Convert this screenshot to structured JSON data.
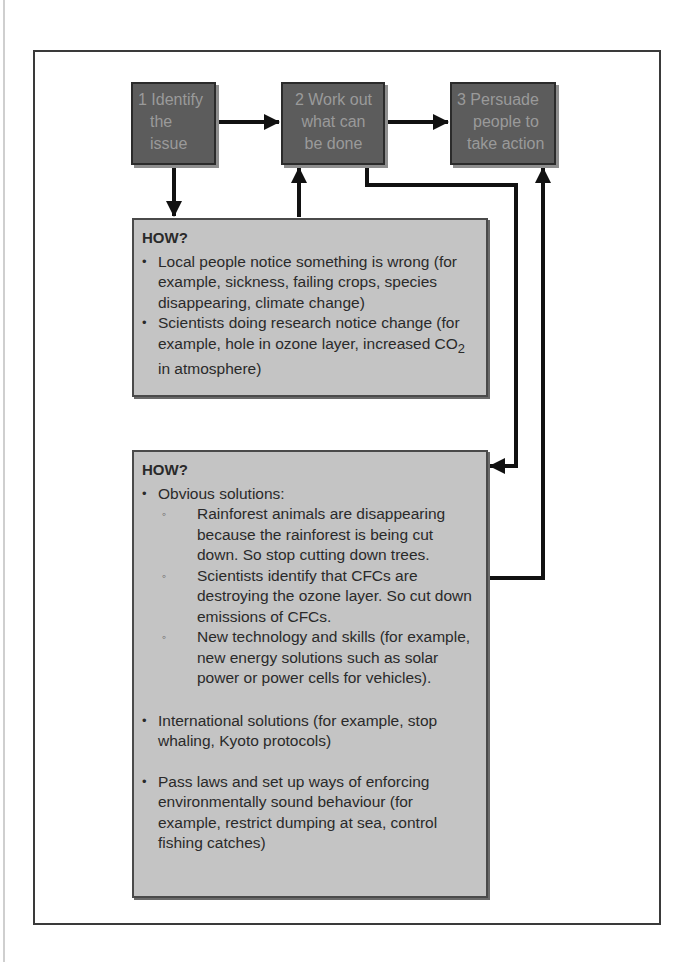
{
  "steps": [
    {
      "label": "1 Identify the issue",
      "lines": [
        "1 Identify",
        "the",
        "issue"
      ]
    },
    {
      "label": "2 Work out what can be done",
      "lines": [
        "2 Work out",
        "what can",
        "be done"
      ]
    },
    {
      "label": "3 Persuade people to take action",
      "lines": [
        "3 Persuade",
        "people to",
        "take action"
      ]
    }
  ],
  "how_box_1": {
    "title": "HOW?",
    "bullets": [
      "Local people notice something is wrong (for example, sickness, failing crops, species disappearing, climate change)",
      "Scientists doing research notice change (for example, hole in ozone layer, increased CO₂ in atmosphere)"
    ]
  },
  "how_box_2": {
    "title": "HOW?",
    "bullet_1": "Obvious solutions:",
    "sub_bullets": [
      "Rainforest animals are disappearing because the rainforest is being cut down. So stop cutting down trees.",
      "Scientists identify that CFCs are destroying the ozone layer. So cut down emissions of CFCs.",
      "New technology and skills (for example, new energy solutions such as solar power or power cells for vehicles)."
    ],
    "bullet_2": "International solutions (for example, stop whaling, Kyoto protocols)",
    "bullet_3": "Pass laws and set up ways of enforcing environmentally sound behaviour (for example, restrict dumping at sea, control fishing catches)"
  },
  "colors": {
    "step_box": "#5c5c5c",
    "how_box": "#c4c4c4",
    "arrow": "#111111"
  }
}
